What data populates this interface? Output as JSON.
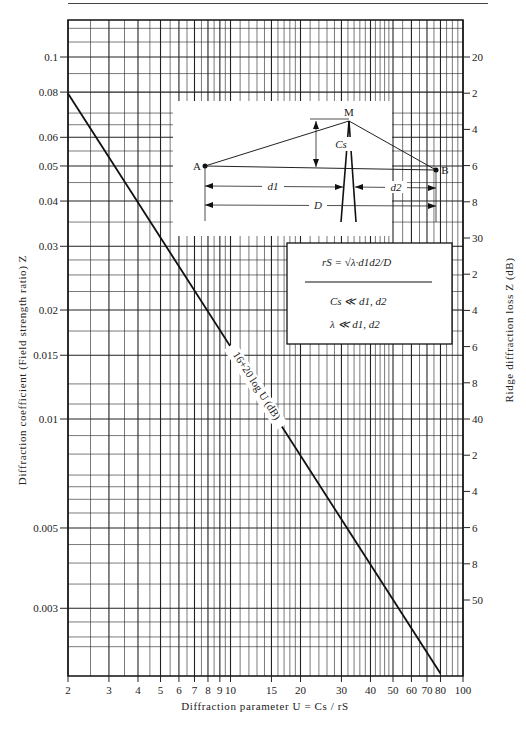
{
  "chart_data": {
    "type": "line",
    "title": "",
    "xlabel": "Diffraction parameter U = Cs / rS",
    "ylabel": "Diffraction coefficient (Field strength ratio) Z",
    "y2label": "Ridge diffraction loss Z (dB)",
    "xscale": "log",
    "yscale": "log",
    "xlim": [
      2,
      100
    ],
    "ylim": [
      0.0022,
      0.125
    ],
    "grid": true,
    "x_ticks": [
      2,
      3,
      4,
      5,
      6,
      7,
      8,
      9,
      10,
      15,
      20,
      30,
      40,
      50,
      60,
      70,
      80,
      100
    ],
    "x_tick_labels": [
      "2",
      "3",
      "4",
      "5",
      "6",
      "7",
      "8",
      "9",
      "10",
      "15",
      "20",
      "30",
      "40",
      "50",
      "60",
      "70",
      "80",
      "100"
    ],
    "y_ticks": [
      0.1,
      0.08,
      0.06,
      0.05,
      0.04,
      0.03,
      0.02,
      0.015,
      0.01,
      0.005,
      0.003
    ],
    "y_tick_labels": [
      "0.1",
      "0.08",
      "0.06",
      "0.05",
      "0.04",
      "0.03",
      "0.02",
      "0.015",
      "0.01",
      "0.005",
      "0.003"
    ],
    "y2_ticks_db": [
      20,
      22,
      24,
      26,
      28,
      30,
      32,
      34,
      36,
      38,
      40,
      42,
      44,
      46,
      48,
      50
    ],
    "y2_tick_labels": [
      "20",
      "2",
      "4",
      "6",
      "8",
      "30",
      "2",
      "4",
      "6",
      "8",
      "40",
      "2",
      "4",
      "6",
      "8",
      "50"
    ],
    "series": [
      {
        "name": "16 + 20 log U (dB)",
        "x": [
          2,
          3,
          5,
          10,
          20,
          30,
          50,
          80
        ],
        "y": [
          0.079,
          0.053,
          0.032,
          0.0158,
          0.0079,
          0.0053,
          0.0032,
          0.002
        ],
        "annotation": "16+20 log U (dB)"
      }
    ],
    "inset": {
      "points": [
        "A",
        "M",
        "B"
      ],
      "labels": [
        "Cs",
        "d1",
        "d2",
        "D"
      ],
      "formula": "rS = √(λ·d1d2/D)",
      "conditions": [
        "Cs ≪ d1, d2",
        "λ ≪ d1, d2"
      ]
    }
  },
  "labels": {
    "line_annotation": "16+20 log U (dB)",
    "point_a": "A",
    "point_b": "B",
    "point_m": "M",
    "cs": "Cs",
    "d1": "d1",
    "d2": "d2",
    "D": "D",
    "formula": "rS = √λ·d1d2/D",
    "cond1": "Cs ≪ d1, d2",
    "cond2": "λ ≪ d1, d2"
  }
}
